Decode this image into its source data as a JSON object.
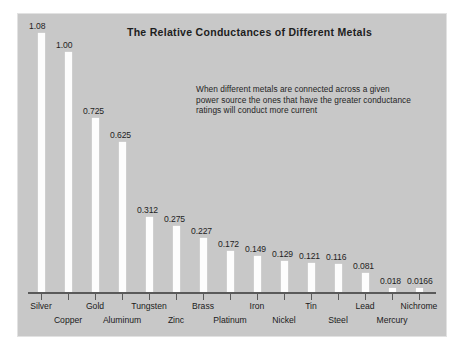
{
  "chart_data": {
    "type": "bar",
    "title": "The Relative Conductances of Different Metals",
    "xlabel": "",
    "ylabel": "",
    "ylim": [
      0,
      1.08
    ],
    "grid": false,
    "legend": "none",
    "annotation": "When different metals are connected across a given power source  the ones that have the greater conductance ratings will conduct more current",
    "categories": [
      "Silver",
      "Copper",
      "Gold",
      "Aluminum",
      "Tungsten",
      "Zinc",
      "Brass",
      "Platinum",
      "Iron",
      "Nickel",
      "Tin",
      "Steel",
      "Lead",
      "Mercury",
      "Nichrome"
    ],
    "values": [
      1.08,
      1.0,
      0.725,
      0.625,
      0.312,
      0.275,
      0.227,
      0.172,
      0.149,
      0.129,
      0.121,
      0.116,
      0.081,
      0.018,
      0.0166
    ],
    "value_labels": [
      "1.08",
      "1.00",
      "0.725",
      "0.625",
      "0.312",
      "0.275",
      "0.227",
      "0.172",
      "0.149",
      "0.129",
      "0.121",
      "0.116",
      "0.081",
      "0.018",
      "0.0166"
    ],
    "label_rows": [
      "a",
      "b",
      "a",
      "b",
      "a",
      "b",
      "a",
      "b",
      "a",
      "b",
      "a",
      "b",
      "a",
      "b",
      "a"
    ]
  },
  "colors": {
    "panel_background": "#c8c8c8",
    "bar": "#fdfdfd",
    "text": "#1d1d1d",
    "axis": "#5a5a5a",
    "page_background": "#ffffff"
  }
}
